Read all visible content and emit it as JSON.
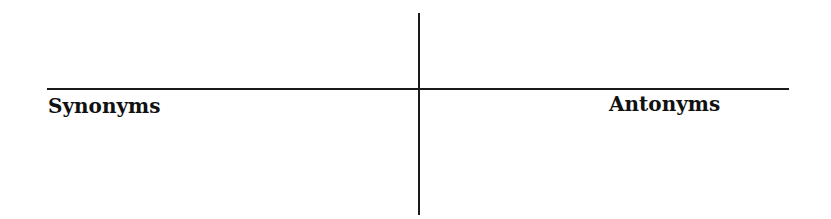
{
  "t_chart": {
    "left_heading": "Synonyms",
    "right_heading": "Antonyms"
  }
}
